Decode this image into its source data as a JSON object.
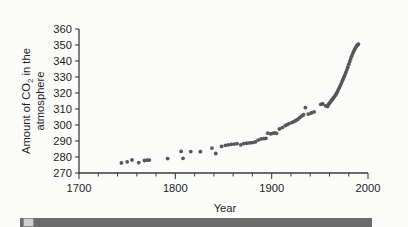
{
  "figure": {
    "background_color": "#fbfbfa",
    "point_color": "#55555a",
    "axis_color": "#3b3b3b"
  },
  "axes": {
    "x_title": "Year",
    "y_title_line1": "Amount of CO",
    "y_title_sub": "2",
    "y_title_line1_tail": " in the",
    "y_title_line2": "atmosphere",
    "x_tick_labels": [
      "1700",
      "1800",
      "1900",
      "2000"
    ],
    "y_tick_labels": [
      "270",
      "280",
      "290",
      "300",
      "310",
      "320",
      "330",
      "340",
      "350",
      "360"
    ]
  },
  "caption": {
    "bar_text": ""
  },
  "chart_data": {
    "type": "scatter",
    "title": "",
    "xlabel": "Year",
    "ylabel": "Amount of CO2 in the atmosphere",
    "xlim": [
      1700,
      2000
    ],
    "ylim": [
      270,
      360
    ],
    "xticks": [
      1700,
      1800,
      1900,
      2000
    ],
    "xminor_step": 20,
    "yticks": [
      270,
      280,
      290,
      300,
      310,
      320,
      330,
      340,
      350,
      360
    ],
    "grid": false,
    "legend": null,
    "series": [
      {
        "name": "Atmospheric CO2 (ppm)",
        "marker": "circle",
        "color": "#55555a",
        "points": [
          [
            1744,
            276.3
          ],
          [
            1750,
            277.0
          ],
          [
            1755,
            278.2
          ],
          [
            1762,
            276.5
          ],
          [
            1768,
            277.8
          ],
          [
            1771,
            278.0
          ],
          [
            1773,
            278.1
          ],
          [
            1792,
            279.0
          ],
          [
            1806,
            283.5
          ],
          [
            1808,
            279.2
          ],
          [
            1816,
            283.4
          ],
          [
            1826,
            283.3
          ],
          [
            1838,
            285.6
          ],
          [
            1842,
            282.2
          ],
          [
            1848,
            286.6
          ],
          [
            1852,
            287.3
          ],
          [
            1855,
            287.6
          ],
          [
            1858,
            287.9
          ],
          [
            1861,
            288.1
          ],
          [
            1864,
            288.3
          ],
          [
            1868,
            287.6
          ],
          [
            1871,
            288.4
          ],
          [
            1874,
            288.6
          ],
          [
            1877,
            288.8
          ],
          [
            1880,
            289.0
          ],
          [
            1883,
            289.4
          ],
          [
            1886,
            290.6
          ],
          [
            1889,
            291.3
          ],
          [
            1892,
            291.5
          ],
          [
            1894,
            291.7
          ],
          [
            1896,
            294.9
          ],
          [
            1899,
            294.5
          ],
          [
            1901,
            294.8
          ],
          [
            1903,
            295.1
          ],
          [
            1905,
            294.8
          ],
          [
            1908,
            297.5
          ],
          [
            1911,
            298.4
          ],
          [
            1914,
            299.6
          ],
          [
            1916,
            300.2
          ],
          [
            1918,
            300.9
          ],
          [
            1921,
            301.5
          ],
          [
            1923,
            302.1
          ],
          [
            1925,
            302.8
          ],
          [
            1927,
            303.5
          ],
          [
            1929,
            304.6
          ],
          [
            1931,
            305.5
          ],
          [
            1933,
            306.4
          ],
          [
            1935,
            310.9
          ],
          [
            1938,
            306.8
          ],
          [
            1941,
            307.5
          ],
          [
            1944,
            308.2
          ],
          [
            1951,
            312.9
          ],
          [
            1953,
            313.2
          ],
          [
            1956,
            312.0
          ],
          [
            1958,
            311.6
          ],
          [
            1959,
            312.8
          ],
          [
            1960,
            313.7
          ],
          [
            1961,
            314.4
          ],
          [
            1962,
            315.3
          ],
          [
            1963,
            316.0
          ],
          [
            1964,
            316.9
          ],
          [
            1965,
            317.6
          ],
          [
            1966,
            318.5
          ],
          [
            1967,
            319.4
          ],
          [
            1968,
            320.5
          ],
          [
            1969,
            321.8
          ],
          [
            1970,
            323.1
          ],
          [
            1971,
            324.3
          ],
          [
            1972,
            325.6
          ],
          [
            1973,
            327.1
          ],
          [
            1974,
            328.5
          ],
          [
            1975,
            329.9
          ],
          [
            1976,
            331.3
          ],
          [
            1977,
            332.8
          ],
          [
            1978,
            334.4
          ],
          [
            1979,
            336.1
          ],
          [
            1980,
            337.9
          ],
          [
            1981,
            339.6
          ],
          [
            1982,
            341.3
          ],
          [
            1983,
            343.0
          ],
          [
            1984,
            344.5
          ],
          [
            1985,
            345.9
          ],
          [
            1986,
            347.1
          ],
          [
            1987,
            348.2
          ],
          [
            1988,
            349.2
          ],
          [
            1989,
            350.0
          ],
          [
            1990,
            350.5
          ]
        ]
      }
    ]
  }
}
